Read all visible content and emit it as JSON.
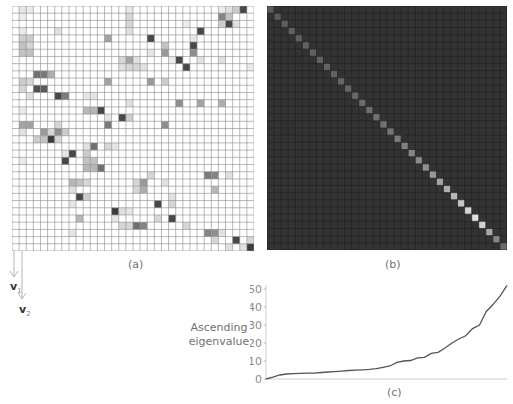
{
  "panels": {
    "a": {
      "label": "(a)",
      "size": 34,
      "cells": [
        [
          0,
          32,
          0.9
        ],
        [
          0,
          31,
          0.25
        ],
        [
          0,
          30,
          0.15
        ],
        [
          0,
          2,
          0.1
        ],
        [
          0,
          1,
          0.12
        ],
        [
          0,
          16,
          0.12
        ],
        [
          0,
          29,
          0.1
        ],
        [
          1,
          29,
          0.6
        ],
        [
          1,
          30,
          0.3
        ],
        [
          1,
          16,
          0.2
        ],
        [
          1,
          1,
          0.08
        ],
        [
          2,
          30,
          0.9
        ],
        [
          2,
          29,
          0.25
        ],
        [
          2,
          16,
          0.2
        ],
        [
          2,
          24,
          0.1
        ],
        [
          2,
          31,
          0.15
        ],
        [
          3,
          26,
          0.9
        ],
        [
          3,
          6,
          0.15
        ],
        [
          3,
          16,
          0.15
        ],
        [
          3,
          1,
          0.1
        ],
        [
          4,
          19,
          0.9
        ],
        [
          4,
          13,
          0.45
        ],
        [
          4,
          1,
          0.25
        ],
        [
          4,
          2,
          0.25
        ],
        [
          4,
          25,
          0.12
        ],
        [
          5,
          25,
          0.9
        ],
        [
          5,
          21,
          0.3
        ],
        [
          5,
          1,
          0.3
        ],
        [
          5,
          2,
          0.2
        ],
        [
          6,
          25,
          0.55
        ],
        [
          6,
          21,
          0.5
        ],
        [
          6,
          1,
          0.3
        ],
        [
          6,
          2,
          0.3
        ],
        [
          6,
          19,
          0.12
        ],
        [
          7,
          23,
          0.9
        ],
        [
          7,
          16,
          0.45
        ],
        [
          7,
          15,
          0.2
        ],
        [
          7,
          17,
          0.15
        ],
        [
          7,
          22,
          0.1
        ],
        [
          7,
          26,
          0.15
        ],
        [
          7,
          29,
          0.15
        ],
        [
          8,
          24,
          0.9
        ],
        [
          8,
          15,
          0.15
        ],
        [
          8,
          16,
          0.2
        ],
        [
          8,
          17,
          0.2
        ],
        [
          8,
          18,
          0.15
        ],
        [
          8,
          33,
          0.1
        ],
        [
          9,
          3,
          0.7
        ],
        [
          9,
          4,
          0.65
        ],
        [
          9,
          5,
          0.4
        ],
        [
          10,
          13,
          0.45
        ],
        [
          10,
          19,
          0.5
        ],
        [
          10,
          21,
          0.25
        ],
        [
          10,
          1,
          0.25
        ],
        [
          10,
          2,
          0.2
        ],
        [
          11,
          3,
          0.85
        ],
        [
          11,
          4,
          0.8
        ],
        [
          11,
          1,
          0.2
        ],
        [
          12,
          6,
          0.9
        ],
        [
          12,
          7,
          0.65
        ],
        [
          12,
          2,
          0.15
        ],
        [
          12,
          10,
          0.12
        ],
        [
          12,
          11,
          0.12
        ],
        [
          13,
          23,
          0.55
        ],
        [
          13,
          26,
          0.45
        ],
        [
          13,
          29,
          0.4
        ],
        [
          13,
          16,
          0.15
        ],
        [
          14,
          12,
          0.9
        ],
        [
          14,
          10,
          0.35
        ],
        [
          14,
          11,
          0.35
        ],
        [
          14,
          1,
          0.1
        ],
        [
          15,
          15,
          0.9
        ],
        [
          15,
          16,
          0.25
        ],
        [
          15,
          13,
          0.12
        ],
        [
          16,
          13,
          0.65
        ],
        [
          16,
          21,
          0.55
        ],
        [
          16,
          1,
          0.45
        ],
        [
          16,
          2,
          0.45
        ],
        [
          16,
          6,
          0.2
        ],
        [
          17,
          4,
          0.5
        ],
        [
          17,
          6,
          0.55
        ],
        [
          17,
          5,
          0.2
        ],
        [
          17,
          7,
          0.25
        ],
        [
          17,
          1,
          0.15
        ],
        [
          18,
          5,
          0.95
        ],
        [
          18,
          4,
          0.3
        ],
        [
          18,
          3,
          0.25
        ],
        [
          18,
          6,
          0.2
        ],
        [
          19,
          11,
          0.7
        ],
        [
          19,
          13,
          0.2
        ],
        [
          19,
          14,
          0.12
        ],
        [
          19,
          10,
          0.15
        ],
        [
          20,
          8,
          0.9
        ],
        [
          20,
          10,
          0.25
        ],
        [
          20,
          7,
          0.12
        ],
        [
          21,
          7,
          0.9
        ],
        [
          21,
          10,
          0.3
        ],
        [
          21,
          11,
          0.3
        ],
        [
          21,
          1,
          0.1
        ],
        [
          22,
          12,
          0.7
        ],
        [
          22,
          10,
          0.35
        ],
        [
          22,
          11,
          0.35
        ],
        [
          23,
          27,
          0.65
        ],
        [
          23,
          28,
          0.6
        ],
        [
          23,
          19,
          0.2
        ],
        [
          23,
          30,
          0.15
        ],
        [
          24,
          8,
          0.35
        ],
        [
          24,
          9,
          0.3
        ],
        [
          24,
          10,
          0.2
        ],
        [
          24,
          17,
          0.2
        ],
        [
          24,
          18,
          0.5
        ],
        [
          24,
          21,
          0.15
        ],
        [
          25,
          28,
          0.35
        ],
        [
          25,
          18,
          0.4
        ],
        [
          25,
          17,
          0.2
        ],
        [
          25,
          8,
          0.15
        ],
        [
          26,
          9,
          0.9
        ],
        [
          26,
          10,
          0.25
        ],
        [
          26,
          22,
          0.15
        ],
        [
          27,
          20,
          0.9
        ],
        [
          27,
          22,
          0.2
        ],
        [
          27,
          8,
          0.12
        ],
        [
          28,
          14,
          0.95
        ],
        [
          28,
          15,
          0.15
        ],
        [
          28,
          16,
          0.12
        ],
        [
          29,
          22,
          0.9
        ],
        [
          29,
          9,
          0.35
        ],
        [
          29,
          20,
          0.2
        ],
        [
          29,
          14,
          0.12
        ],
        [
          30,
          17,
          0.7
        ],
        [
          30,
          18,
          0.6
        ],
        [
          30,
          15,
          0.2
        ],
        [
          30,
          16,
          0.2
        ],
        [
          30,
          24,
          0.2
        ],
        [
          31,
          27,
          0.6
        ],
        [
          31,
          28,
          0.55
        ],
        [
          31,
          8,
          0.12
        ],
        [
          31,
          29,
          0.15
        ],
        [
          32,
          31,
          0.9
        ],
        [
          32,
          28,
          0.2
        ],
        [
          32,
          33,
          0.2
        ],
        [
          33,
          33,
          0.95
        ],
        [
          33,
          30,
          0.15
        ],
        [
          33,
          32,
          0.15
        ]
      ]
    },
    "b": {
      "label": "(b)",
      "size": 34,
      "background": "#333333",
      "diagonal_brightness": [
        0.36,
        0.36,
        0.37,
        0.38,
        0.38,
        0.38,
        0.38,
        0.39,
        0.39,
        0.39,
        0.4,
        0.4,
        0.41,
        0.42,
        0.43,
        0.44,
        0.45,
        0.46,
        0.48,
        0.5,
        0.52,
        0.54,
        0.57,
        0.6,
        0.64,
        0.68,
        0.72,
        0.78,
        0.84,
        0.88,
        0.82,
        0.65,
        0.52,
        0.42
      ]
    },
    "c": {
      "label": "(c)"
    }
  },
  "arrows": {
    "v1": "v",
    "v1_sub": "1",
    "v2": "v",
    "v2_sub": "2"
  },
  "chart_data": {
    "type": "line",
    "title": "",
    "xlabel": "",
    "ylabel": "Ascending eigenvalue",
    "ylabel_lines": [
      "Ascending",
      "eigenvalue"
    ],
    "yticks": [
      0,
      10,
      20,
      30,
      40,
      50
    ],
    "ylim": [
      0,
      52
    ],
    "grid": false,
    "series": [
      {
        "name": "eigenvalues",
        "values": [
          0,
          1,
          2.2,
          2.8,
          3,
          3.1,
          3.2,
          3.3,
          3.6,
          3.9,
          4.1,
          4.4,
          4.7,
          4.9,
          5.1,
          5.4,
          5.8,
          6.5,
          7.2,
          9.2,
          10,
          10.3,
          11.8,
          12,
          14.2,
          14.8,
          17.2,
          20,
          22.2,
          24,
          28,
          30,
          37.5,
          41.5,
          46,
          52
        ]
      }
    ]
  }
}
